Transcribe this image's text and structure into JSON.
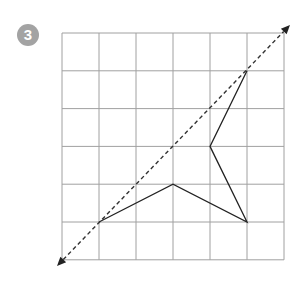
{
  "problem": {
    "number": "3"
  },
  "grid": {
    "cols": 6,
    "rows": 6,
    "left": 62,
    "top": 33,
    "cell_w": 37,
    "cell_h": 37.8,
    "line_color": "#a0a0a0"
  },
  "mirror_line": {
    "style": "dashed",
    "from": [
      57,
      266
    ],
    "to": [
      290,
      25
    ],
    "color": "#333333"
  },
  "shape": {
    "color": "#222222",
    "points_grid": [
      [
        1,
        5
      ],
      [
        3,
        4
      ],
      [
        5,
        5
      ],
      [
        4,
        3
      ],
      [
        5,
        1
      ]
    ]
  }
}
